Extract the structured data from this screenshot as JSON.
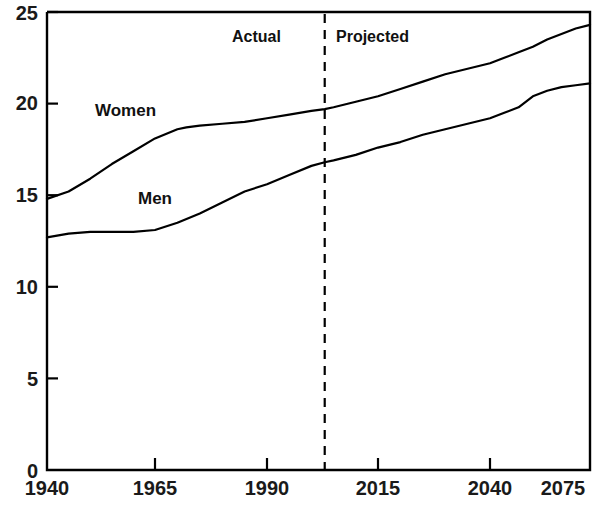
{
  "chart_data": {
    "type": "line",
    "title": "",
    "subtitle": "",
    "xlabel": "",
    "ylabel": "",
    "xlim": [
      1940,
      2075
    ],
    "ylim": [
      0,
      25
    ],
    "grid": false,
    "legend_position": "inline-series-labels",
    "x_ticks": [
      1940,
      1965,
      1990,
      2015,
      2040,
      2075
    ],
    "x_tick_labels": [
      "1940",
      "1965",
      "1990",
      "2015",
      "2040",
      "2075"
    ],
    "y_ticks": [
      0,
      5,
      10,
      15,
      20,
      25
    ],
    "y_tick_labels": [
      "0",
      "5",
      "10",
      "15",
      "20",
      "25"
    ],
    "annotations": [
      {
        "text": "Actual",
        "x": 2003,
        "align": "right"
      },
      {
        "text": "Projected",
        "x": 2003,
        "align": "left"
      }
    ],
    "divider": {
      "x": 2003,
      "style": "dashed",
      "label_left": "Actual",
      "label_right": "Projected"
    },
    "series": [
      {
        "name": "Women",
        "label": "Women",
        "color": "#000000",
        "x": [
          1940,
          1945,
          1950,
          1955,
          1960,
          1965,
          1970,
          1972,
          1975,
          1980,
          1985,
          1990,
          1995,
          2000,
          2003,
          2005,
          2010,
          2015,
          2020,
          2025,
          2030,
          2035,
          2040,
          2045,
          2050,
          2055,
          2060,
          2065,
          2070,
          2075
        ],
        "values": [
          14.8,
          15.2,
          15.9,
          16.7,
          17.4,
          18.1,
          18.6,
          18.7,
          18.8,
          18.9,
          19.0,
          19.2,
          19.4,
          19.6,
          19.7,
          19.8,
          20.1,
          20.4,
          20.8,
          21.2,
          21.6,
          21.9,
          22.2,
          22.5,
          22.8,
          23.1,
          23.5,
          23.8,
          24.1,
          24.3
        ]
      },
      {
        "name": "Men",
        "label": "Men",
        "color": "#000000",
        "x": [
          1940,
          1945,
          1950,
          1955,
          1960,
          1965,
          1970,
          1975,
          1980,
          1985,
          1990,
          1995,
          2000,
          2003,
          2005,
          2010,
          2015,
          2020,
          2025,
          2030,
          2035,
          2040,
          2045,
          2050,
          2055,
          2060,
          2065,
          2070,
          2075
        ],
        "values": [
          12.7,
          12.9,
          13.0,
          13.0,
          13.0,
          13.1,
          13.5,
          14.0,
          14.6,
          15.2,
          15.6,
          16.1,
          16.6,
          16.8,
          16.9,
          17.2,
          17.6,
          17.9,
          18.3,
          18.6,
          18.9,
          19.2,
          19.5,
          19.8,
          20.4,
          20.7,
          20.9,
          21.0,
          21.1
        ]
      }
    ],
    "axis_color": "#000000",
    "line_color": "#000000",
    "background_color": "#ffffff"
  },
  "labels": {
    "women": "Women",
    "men": "Men",
    "actual": "Actual",
    "projected": "Projected"
  },
  "y_axis": {
    "t0": "0",
    "t1": "5",
    "t2": "10",
    "t3": "15",
    "t4": "20",
    "t5": "25"
  },
  "x_axis": {
    "t0": "1940",
    "t1": "1965",
    "t2": "1990",
    "t3": "2015",
    "t4": "2040",
    "t5": "2075"
  }
}
